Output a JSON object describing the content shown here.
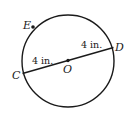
{
  "figure": {
    "type": "circle-diagram",
    "circle": {
      "center_label": "O",
      "stroke": "#1a1a1a"
    },
    "points": {
      "center": "O",
      "c": "C",
      "d": "D",
      "e": "E"
    },
    "segments": {
      "oc_length": "4 in.",
      "od_length": "4 in."
    }
  }
}
